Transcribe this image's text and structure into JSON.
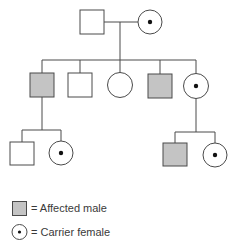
{
  "diagram": {
    "type": "pedigree",
    "colors": {
      "line": "#4a4a4a",
      "affected_fill": "#c4c4c4",
      "unaffected_fill": "#ffffff",
      "carrier_dot": "#111111"
    },
    "generations": [
      {
        "generation": "I",
        "individuals": [
          {
            "id": "I-1",
            "sex": "male",
            "status": "unaffected"
          },
          {
            "id": "I-2",
            "sex": "female",
            "status": "carrier"
          }
        ]
      },
      {
        "generation": "II",
        "individuals": [
          {
            "id": "II-1",
            "sex": "male",
            "status": "affected"
          },
          {
            "id": "II-2",
            "sex": "male",
            "status": "unaffected"
          },
          {
            "id": "II-3",
            "sex": "female",
            "status": "unaffected"
          },
          {
            "id": "II-4",
            "sex": "male",
            "status": "affected"
          },
          {
            "id": "II-5",
            "sex": "female",
            "status": "carrier"
          }
        ]
      },
      {
        "generation": "III",
        "individuals": [
          {
            "id": "III-1",
            "sex": "male",
            "status": "unaffected",
            "parent": "II-1"
          },
          {
            "id": "III-2",
            "sex": "female",
            "status": "carrier",
            "parent": "II-1"
          },
          {
            "id": "III-3",
            "sex": "male",
            "status": "affected",
            "parent": "II-5"
          },
          {
            "id": "III-4",
            "sex": "female",
            "status": "carrier",
            "parent": "II-5"
          }
        ]
      }
    ]
  },
  "legend": {
    "items": [
      {
        "symbol": "affected-male",
        "label": "= Affected male"
      },
      {
        "symbol": "carrier-female",
        "label": "= Carrier female"
      }
    ]
  }
}
